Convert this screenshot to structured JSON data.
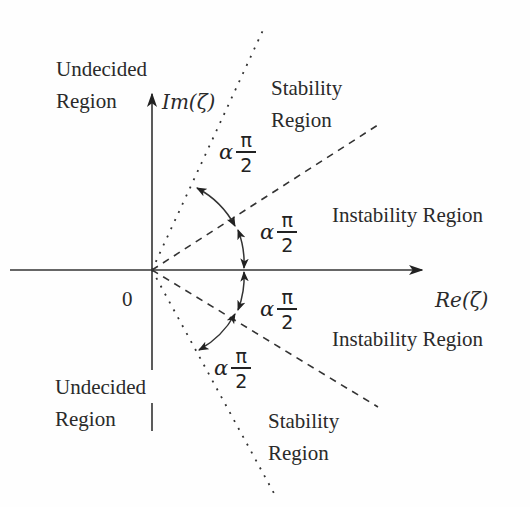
{
  "figure": {
    "axes": {
      "origin_label": "0",
      "x_axis_label": "Re(ζ)",
      "y_axis_label": "Im(ζ)"
    },
    "regions": {
      "undecided_top": [
        "Undecided",
        "Region"
      ],
      "stability_top": [
        "Stability",
        "Region"
      ],
      "instability_top": "Instability Region",
      "instability_bottom": "Instability Region",
      "undecided_bottom": [
        "Undecided",
        "Region"
      ],
      "stability_bottom": [
        "Stability",
        "Region"
      ]
    },
    "angle_labels": [
      {
        "alpha": "α",
        "numerator": "π",
        "denominator": "2"
      },
      {
        "alpha": "α",
        "numerator": "π",
        "denominator": "2"
      },
      {
        "alpha": "α",
        "numerator": "π",
        "denominator": "2"
      },
      {
        "alpha": "α",
        "numerator": "π",
        "denominator": "2"
      }
    ],
    "colors": {
      "ink": "#222222",
      "background": "#fefefe"
    }
  }
}
